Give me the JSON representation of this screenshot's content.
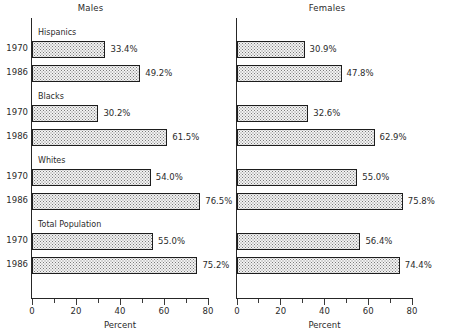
{
  "chart_data": {
    "type": "bar",
    "title": "",
    "orientation": "horizontal",
    "xlabel": "Percent",
    "ylabel": "",
    "xlim": [
      0,
      80
    ],
    "grid": false,
    "legend": null,
    "panels": [
      {
        "name": "Males",
        "show_category_labels": true,
        "show_year_labels": true,
        "groups": [
          {
            "label": "Hispanics",
            "bars": [
              {
                "year": "1970",
                "value": 33.4,
                "value_label": "33.4%"
              },
              {
                "year": "1986",
                "value": 49.2,
                "value_label": "49.2%"
              }
            ]
          },
          {
            "label": "Blacks",
            "bars": [
              {
                "year": "1970",
                "value": 30.2,
                "value_label": "30.2%"
              },
              {
                "year": "1986",
                "value": 61.5,
                "value_label": "61.5%"
              }
            ]
          },
          {
            "label": "Whites",
            "bars": [
              {
                "year": "1970",
                "value": 54.0,
                "value_label": "54.0%"
              },
              {
                "year": "1986",
                "value": 76.5,
                "value_label": "76.5%"
              }
            ]
          },
          {
            "label": "Total Population",
            "bars": [
              {
                "year": "1970",
                "value": 55.0,
                "value_label": "55.0%"
              },
              {
                "year": "1986",
                "value": 75.2,
                "value_label": "75.2%"
              }
            ]
          }
        ]
      },
      {
        "name": "Females",
        "show_category_labels": false,
        "show_year_labels": false,
        "groups": [
          {
            "label": "Hispanics",
            "bars": [
              {
                "year": "1970",
                "value": 30.9,
                "value_label": "30.9%"
              },
              {
                "year": "1986",
                "value": 47.8,
                "value_label": "47.8%"
              }
            ]
          },
          {
            "label": "Blacks",
            "bars": [
              {
                "year": "1970",
                "value": 32.6,
                "value_label": "32.6%"
              },
              {
                "year": "1986",
                "value": 62.9,
                "value_label": "62.9%"
              }
            ]
          },
          {
            "label": "Whites",
            "bars": [
              {
                "year": "1970",
                "value": 55.0,
                "value_label": "55.0%"
              },
              {
                "year": "1986",
                "value": 75.8,
                "value_label": "75.8%"
              }
            ]
          },
          {
            "label": "Total Population",
            "bars": [
              {
                "year": "1970",
                "value": 56.4,
                "value_label": "56.4%"
              },
              {
                "year": "1986",
                "value": 74.4,
                "value_label": "74.4%"
              }
            ]
          }
        ]
      }
    ],
    "x_ticks_major": [
      {
        "value": 0,
        "label": "0"
      },
      {
        "value": 20,
        "label": "20"
      },
      {
        "value": 40,
        "label": "40"
      },
      {
        "value": 60,
        "label": "60"
      },
      {
        "value": 80,
        "label": "80"
      }
    ],
    "x_ticks_minor": [
      10,
      30,
      50,
      70
    ],
    "colors": {
      "bar_fill": "#f2f2f2",
      "bar_stipple": "#7a7a7a",
      "bar_border": "#1d1d1d",
      "axis": "#262626",
      "text": "#2b2b2b",
      "background": "#ffffff"
    }
  }
}
